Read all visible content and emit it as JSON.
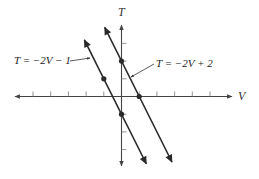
{
  "chart_data": {
    "type": "line",
    "title": "",
    "xlabel": "V",
    "ylabel": "T",
    "xlim": [
      -6,
      6
    ],
    "ylim": [
      -4,
      4
    ],
    "x_ticks": [
      -5,
      -4,
      -3,
      -2,
      -1,
      1,
      2,
      3,
      4,
      5
    ],
    "y_ticks": [
      -3,
      -2,
      -1,
      1,
      2,
      3
    ],
    "grid": false,
    "legend": "none",
    "series": [
      {
        "name": "T = −2V − 1",
        "equation": "T = -2V - 1",
        "slope": -2,
        "intercept": -1,
        "marked_points": [
          [
            -1,
            1
          ],
          [
            0,
            -1
          ]
        ],
        "x_range": [
          -2.1,
          1.4
        ]
      },
      {
        "name": "T = −2V + 2",
        "equation": "T = -2V + 2",
        "slope": -2,
        "intercept": 2,
        "marked_points": [
          [
            0,
            2
          ],
          [
            1,
            0
          ]
        ],
        "x_range": [
          -0.95,
          2.85
        ]
      }
    ],
    "annotations": [
      {
        "text": "T = −2V − 1",
        "points_to_series": 0
      },
      {
        "text": "T = −2V + 2",
        "points_to_series": 1
      }
    ]
  },
  "labels": {
    "x_axis": "V",
    "y_axis": "T",
    "line1": "T = −2V − 1",
    "line2": "T = −2V + 2"
  },
  "colors": {
    "axis": "#444444",
    "line": "#2a2a2a",
    "text": "#222222"
  }
}
